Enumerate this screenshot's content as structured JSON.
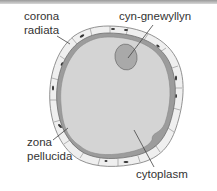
{
  "diagram": {
    "labels": {
      "corona_radiata_line1": "corona",
      "corona_radiata_line2": "radiata",
      "nucleus": "cyn-gnewyllyn",
      "zona_pellucida_line1": "zona",
      "zona_pellucida_line2": "pellucida",
      "cytoplasm": "cytoplasm"
    },
    "colors": {
      "cytoplasm": "#d4d4d4",
      "nucleus": "#a9a9a9",
      "zona_pellucida": "#9c9c9c",
      "corona_cells": "#eeeeee",
      "cell_nuclei": "#333333",
      "leader_lines": "#444444"
    }
  }
}
